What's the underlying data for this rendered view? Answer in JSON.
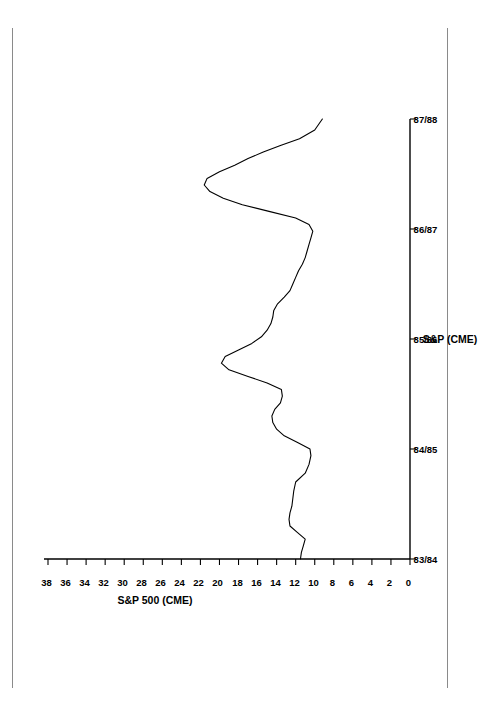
{
  "chart_data": {
    "type": "line",
    "title": "S&P 500 (CME)",
    "xlabel": "S&P (CME)",
    "ylabel": "",
    "orientation": "rotated-90-ccw",
    "grid": false,
    "legend": null,
    "xlim": [
      0,
      4
    ],
    "ylim": [
      0,
      38
    ],
    "yticks": [
      0,
      2,
      4,
      6,
      8,
      10,
      12,
      14,
      16,
      18,
      20,
      22,
      24,
      26,
      28,
      30,
      32,
      34,
      36,
      38
    ],
    "ytick_labels": [
      "0",
      "2",
      "4",
      "6",
      "8",
      "10",
      "12",
      "14",
      "16",
      "18",
      "20",
      "22",
      "24",
      "26",
      "28",
      "30",
      "32",
      "34",
      "36",
      "38"
    ],
    "categories": [
      "83/84",
      "84/85",
      "85/86",
      "86/87",
      "87/88"
    ],
    "xtick_positions": [
      0,
      1,
      2,
      3,
      4
    ],
    "series": [
      {
        "name": "S&P 500 (CME)",
        "x": [
          0.0,
          0.06,
          0.12,
          0.18,
          0.24,
          0.3,
          0.36,
          0.42,
          0.48,
          0.55,
          0.62,
          0.7,
          0.78,
          0.86,
          0.94,
          1.0,
          1.06,
          1.12,
          1.18,
          1.24,
          1.3,
          1.36,
          1.42,
          1.48,
          1.54,
          1.6,
          1.66,
          1.72,
          1.78,
          1.84,
          1.9,
          1.96,
          2.02,
          2.08,
          2.14,
          2.2,
          2.26,
          2.32,
          2.38,
          2.44,
          2.5,
          2.56,
          2.62,
          2.68,
          2.74,
          2.8,
          2.86,
          2.92,
          2.98,
          3.04,
          3.1,
          3.16,
          3.22,
          3.28,
          3.34,
          3.4,
          3.46,
          3.52,
          3.58,
          3.64,
          3.7,
          3.76,
          3.82,
          3.9,
          4.0
        ],
        "values": [
          11.5,
          11.4,
          11.2,
          11.0,
          11.8,
          12.6,
          12.7,
          12.6,
          12.4,
          12.3,
          12.2,
          12.0,
          11.0,
          10.6,
          10.4,
          10.5,
          11.8,
          13.2,
          14.0,
          14.4,
          14.5,
          14.2,
          13.6,
          13.4,
          13.5,
          15.0,
          17.0,
          19.0,
          19.8,
          19.4,
          18.0,
          16.6,
          15.6,
          15.0,
          14.6,
          14.4,
          14.3,
          13.9,
          13.2,
          12.6,
          12.3,
          12.0,
          11.7,
          11.3,
          11.0,
          10.8,
          10.6,
          10.4,
          10.2,
          10.6,
          12.0,
          14.8,
          17.6,
          19.6,
          21.0,
          21.6,
          21.3,
          20.0,
          18.4,
          17.0,
          15.4,
          13.6,
          11.6,
          10.0,
          9.2
        ]
      }
    ],
    "annotations": []
  },
  "figure": {
    "title": "S&P 500 (CME)",
    "axis_title": "S&P (CME)"
  }
}
